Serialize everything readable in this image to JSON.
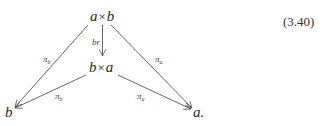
{
  "equation_number": "(3.40)",
  "diagram": {
    "nodes": {
      "top": {
        "left": "a",
        "op": "×",
        "right": "b"
      },
      "middle": {
        "left": "b",
        "op": "×",
        "right": "a"
      },
      "bottom_left": {
        "text": "b"
      },
      "bottom_right": {
        "text": "a."
      }
    },
    "arrows": {
      "vertical": {
        "label": "br",
        "from": "a×b",
        "to": "b×a"
      },
      "top_left": {
        "label_base": "π",
        "label_sub": "b",
        "from": "a×b",
        "to": "b"
      },
      "top_right": {
        "label_base": "π",
        "label_sub": "a",
        "from": "a×b",
        "to": "a"
      },
      "mid_left": {
        "label_base": "π",
        "label_sub": "b",
        "from": "b×a",
        "to": "b"
      },
      "mid_right": {
        "label_base": "π",
        "label_sub": "a",
        "from": "b×a",
        "to": "a"
      }
    }
  }
}
